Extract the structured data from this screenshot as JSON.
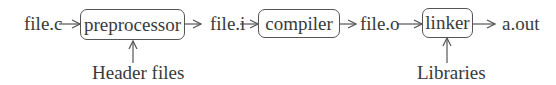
{
  "diagram": {
    "type": "compilation-pipeline",
    "inputs": {
      "source": "file.c"
    },
    "stages": [
      {
        "id": "preprocessor",
        "label": "preprocessor",
        "extra_input": "Header files",
        "output": "file.i"
      },
      {
        "id": "compiler",
        "label": "compiler",
        "output": "file.o"
      },
      {
        "id": "linker",
        "label": "linker",
        "extra_input": "Libraries",
        "output": "a.out"
      }
    ],
    "labels": {
      "file_c": "file.c",
      "file_i": "file.i",
      "file_o": "file.o",
      "a_out": "a.out",
      "header_files": "Header files",
      "libraries": "Libraries"
    },
    "colors": {
      "line": "#555555",
      "text": "#3a3a3a",
      "background": "#ffffff"
    }
  }
}
